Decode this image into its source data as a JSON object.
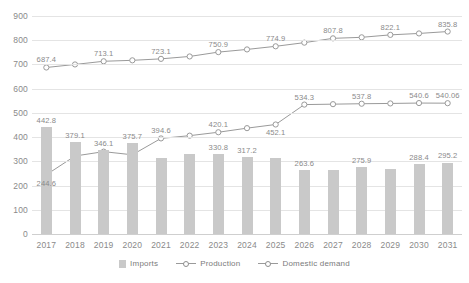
{
  "chart_data": {
    "type": "bar",
    "title": "",
    "subtitle": "",
    "xlabel": "",
    "ylabel": "",
    "ylim": [
      0,
      900
    ],
    "ytick_step": 100,
    "grid": true,
    "legend_position": "bottom",
    "categories": [
      "2017",
      "2018",
      "2019",
      "2020",
      "2021",
      "2022",
      "2023",
      "2024",
      "2025",
      "2026",
      "2027",
      "2028",
      "2029",
      "2030",
      "2031"
    ],
    "yticks": [
      "900",
      "800",
      "700",
      "600",
      "500",
      "400",
      "300",
      "200",
      "100",
      "0"
    ],
    "series": [
      {
        "name": "Imports",
        "type": "bar",
        "color": "#c9c9c9",
        "values": [
          442.8,
          379.1,
          346.1,
          375.7,
          312.0,
          331.0,
          330.8,
          317.2,
          312.0,
          263.6,
          263.0,
          275.9,
          270.0,
          288.4,
          295.2
        ],
        "labels": [
          "442.8",
          "379.1",
          "346.1",
          "375.7",
          "",
          "",
          "330.8",
          "317.2",
          "",
          "263.6",
          "",
          "275.9",
          "",
          "288.4",
          "295.2"
        ]
      },
      {
        "name": "Production",
        "type": "line",
        "color": "#9a9a9a",
        "values": [
          687.4,
          700.0,
          713.1,
          717.0,
          723.1,
          733.0,
          750.9,
          762.0,
          774.9,
          790.0,
          807.8,
          812.0,
          822.1,
          828.0,
          835.8
        ],
        "labels": [
          "687.4",
          "",
          "713.1",
          "",
          "723.1",
          "",
          "750.9",
          "",
          "774.9",
          "",
          "807.8",
          "",
          "822.1",
          "",
          "835.8"
        ]
      },
      {
        "name": "Domestic demand",
        "type": "line",
        "color": "#9a9a9a",
        "values": [
          244.6,
          322.0,
          340.0,
          327.0,
          394.6,
          406.0,
          420.1,
          437.0,
          452.1,
          534.3,
          536.0,
          537.8,
          539.0,
          540.6,
          540.06
        ],
        "labels": [
          "244.6",
          "",
          "",
          "",
          "394.6",
          "",
          "420.1",
          "",
          "452.1",
          "534.3",
          "",
          "537.8",
          "",
          "540.6",
          "540.06"
        ]
      }
    ],
    "legend": [
      {
        "label": "Imports",
        "marker": "bar-swatch"
      },
      {
        "label": "Production",
        "marker": "line-marker"
      },
      {
        "label": "Domestic demand",
        "marker": "line-marker"
      }
    ]
  }
}
